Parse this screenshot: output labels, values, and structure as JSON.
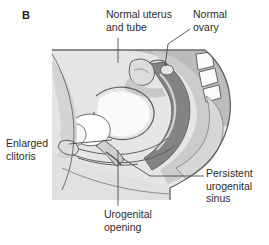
{
  "figure": {
    "panel_letter": "B",
    "kind": "medical-illustration",
    "view": "sagittal section of female pelvis",
    "background_color": "#ffffff",
    "text_color": "#2b2b2b",
    "leader_line_color": "#4a4a4a"
  },
  "labels": {
    "normal_uterus_and_tube": "Normal uterus\nand tube",
    "normal_ovary": "Normal\novary",
    "enlarged_clitoris": "Enlarged\nclitoris",
    "persistent_urogenital_sinus": "Persistent\nurogenital\nsinus",
    "urogenital_opening": "Urogenital\nopening"
  },
  "palette": {
    "skin_light": "#e3e3e3",
    "skin_mid": "#d2d2d2",
    "tissue_light": "#cfcfcf",
    "tissue_mid": "#b8b8b8",
    "tissue_dark": "#9a9a9a",
    "organ_dark": "#8a8a8a",
    "rectum_dark": "#7b7b7b",
    "lumen_white": "#ffffff",
    "outline": "#4a4a4a"
  }
}
